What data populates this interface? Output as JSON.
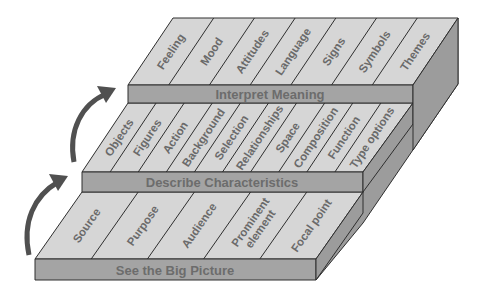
{
  "diagram": {
    "type": "staircase",
    "colors": {
      "top_face": "#d6d6d6",
      "front_face": "#a4a4a4",
      "side_face": "#9c9c9c",
      "text": "#6a6a6a",
      "arrow": "#505050",
      "outline": "#2e2e2e"
    },
    "steps": [
      {
        "label": "See the Big Picture",
        "items": [
          "Source",
          "Purpose",
          "Audience",
          "Prominent element",
          "Focal point"
        ]
      },
      {
        "label": "Describe Characteristics",
        "items": [
          "Objects",
          "Figures",
          "Action",
          "Background",
          "Selection",
          "Relationships",
          "Space",
          "Composition",
          "Function",
          "Type options"
        ]
      },
      {
        "label": "Interpret Meaning",
        "items": [
          "Feeling",
          "Mood",
          "Attitudes",
          "Language",
          "Signs",
          "Symbols",
          "Themes"
        ]
      }
    ],
    "arrows": [
      {
        "from": "See the Big Picture",
        "to": "Describe Characteristics"
      },
      {
        "from": "Describe Characteristics",
        "to": "Interpret Meaning"
      }
    ]
  }
}
